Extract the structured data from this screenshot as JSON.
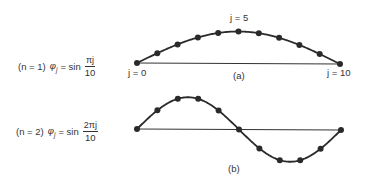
{
  "diagram": {
    "panel_a": {
      "equation": {
        "mode": "(n = 1)",
        "lhs": "φ",
        "sub": "j",
        "eq": "= sin",
        "numerator": "πj",
        "denominator": "10"
      },
      "label_j0": "j = 0",
      "label_j5": "j = 5",
      "label_j10": "j = 10",
      "caption": "(a)",
      "n": 1,
      "points": 11
    },
    "panel_b": {
      "equation": {
        "mode": "(n = 2)",
        "lhs": "φ",
        "sub": "j",
        "eq": "= sin",
        "numerator": "2πj",
        "denominator": "10"
      },
      "caption": "(b)",
      "n": 2,
      "points": 11
    },
    "colors": {
      "line": "#2a2a2a",
      "dot": "#2a2a2a",
      "text": "#333333"
    }
  }
}
